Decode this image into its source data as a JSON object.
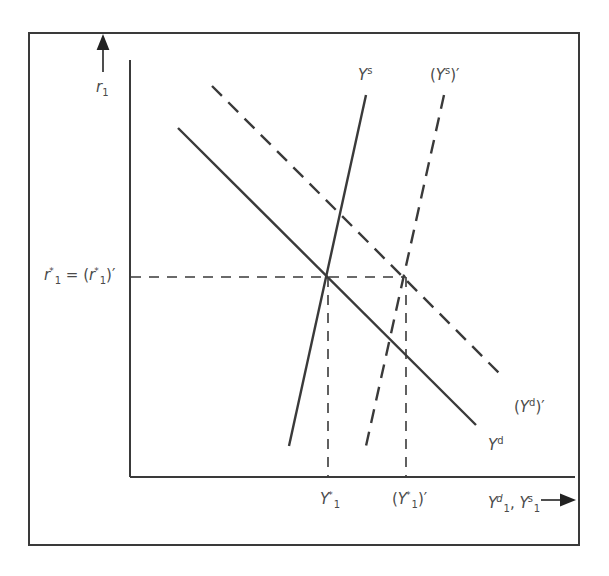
{
  "diagram": {
    "axes": {
      "y_label": "r_1",
      "x_label": "Y_1^d, Y_1^s"
    },
    "curves": [
      {
        "id": "Ys",
        "label": "Y^s",
        "style": "solid",
        "kind": "supply"
      },
      {
        "id": "Ys_prime",
        "label": "(Y^s)'",
        "style": "dashed",
        "kind": "supply"
      },
      {
        "id": "Yd",
        "label": "Y^d",
        "style": "solid",
        "kind": "demand"
      },
      {
        "id": "Yd_prime",
        "label": "(Y^d)'",
        "style": "dashed",
        "kind": "demand"
      }
    ],
    "equilibrium_labels": {
      "rate": "r_1^* = (r_1^*)'",
      "quantity": "Y_1^*",
      "quantity_new": "(Y_1^*)'"
    },
    "colors": {
      "line": "#3a3a3a",
      "text": "#4a4a4a",
      "background": "#ffffff"
    }
  }
}
